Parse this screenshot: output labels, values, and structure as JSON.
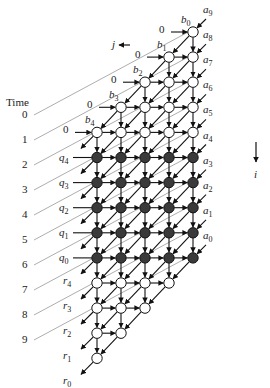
{
  "title_label": "Time",
  "colors": {
    "line": "#111111",
    "time_line": "#8a8a8a",
    "node_open_fill": "#ffffff",
    "node_filled_fill": "#3a3a3a",
    "node_stroke": "#111111"
  },
  "direction_labels": {
    "j": "j",
    "i": "i"
  },
  "time_labels": [
    "0",
    "1",
    "2",
    "3",
    "4",
    "5",
    "6",
    "7",
    "8",
    "9"
  ],
  "zero_inputs": [
    "0",
    "0",
    "0",
    "0",
    "0"
  ],
  "b_labels": [
    {
      "base": "b",
      "sub": "0"
    },
    {
      "base": "b",
      "sub": "1"
    },
    {
      "base": "b",
      "sub": "2"
    },
    {
      "base": "b",
      "sub": "3"
    },
    {
      "base": "b",
      "sub": "4"
    }
  ],
  "a_labels": [
    {
      "base": "a",
      "sub": "9"
    },
    {
      "base": "a",
      "sub": "8"
    },
    {
      "base": "a",
      "sub": "7"
    },
    {
      "base": "a",
      "sub": "6"
    },
    {
      "base": "a",
      "sub": "5"
    },
    {
      "base": "a",
      "sub": "4"
    },
    {
      "base": "a",
      "sub": "3"
    },
    {
      "base": "a",
      "sub": "2"
    },
    {
      "base": "a",
      "sub": "1"
    },
    {
      "base": "a",
      "sub": "0"
    }
  ],
  "q_labels": [
    {
      "base": "q",
      "sub": "4"
    },
    {
      "base": "q",
      "sub": "3"
    },
    {
      "base": "q",
      "sub": "2"
    },
    {
      "base": "q",
      "sub": "1"
    },
    {
      "base": "q",
      "sub": "0"
    }
  ],
  "r_labels": [
    {
      "base": "r",
      "sub": "4"
    },
    {
      "base": "r",
      "sub": "3"
    },
    {
      "base": "r",
      "sub": "2"
    },
    {
      "base": "r",
      "sub": "1"
    },
    {
      "base": "r",
      "sub": "0"
    }
  ],
  "grid": {
    "columns": 5,
    "rows": 14,
    "row_types": [
      "open",
      "open",
      "open",
      "open",
      "open",
      "filled",
      "filled",
      "filled",
      "filled",
      "filled",
      "open",
      "open",
      "open",
      "open"
    ],
    "row_col_range": [
      [
        4,
        4
      ],
      [
        3,
        4
      ],
      [
        2,
        4
      ],
      [
        1,
        4
      ],
      [
        0,
        4
      ],
      [
        0,
        4
      ],
      [
        0,
        4
      ],
      [
        0,
        4
      ],
      [
        0,
        4
      ],
      [
        0,
        4
      ],
      [
        0,
        3
      ],
      [
        0,
        2
      ],
      [
        0,
        1
      ],
      [
        0,
        0
      ]
    ]
  }
}
